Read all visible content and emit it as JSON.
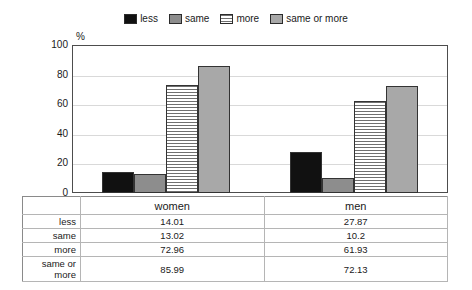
{
  "chart_data": {
    "type": "bar",
    "title": "",
    "xlabel": "",
    "ylabel": "%",
    "ylim": [
      0,
      100
    ],
    "yticks": [
      100,
      80,
      60,
      40,
      20,
      0
    ],
    "grid": true,
    "legend_position": "top-center",
    "categories": [
      "women",
      "men"
    ],
    "series": [
      {
        "name": "less",
        "values": [
          14.01,
          27.87
        ],
        "pattern": "solid-black",
        "color": "#111111"
      },
      {
        "name": "same",
        "values": [
          13.02,
          10.2
        ],
        "pattern": "solid-gray",
        "color": "#8d8d8d"
      },
      {
        "name": "more",
        "values": [
          72.96,
          61.93
        ],
        "pattern": "horizontal-lines",
        "color": "#ffffff"
      },
      {
        "name": "same or more",
        "values": [
          85.99,
          72.13
        ],
        "pattern": "solid-light-gray",
        "color": "#a8a8a8"
      }
    ]
  },
  "legend": {
    "items": [
      {
        "label": "less"
      },
      {
        "label": "same"
      },
      {
        "label": "more"
      },
      {
        "label": "same or more"
      }
    ]
  },
  "axis": {
    "unit_label": "%",
    "ticks": [
      "100",
      "80",
      "60",
      "40",
      "20",
      "0"
    ]
  },
  "categories": [
    {
      "label": "women"
    },
    {
      "label": "men"
    }
  ],
  "table": {
    "rows": [
      {
        "label": "less",
        "women": "14.01",
        "men": "27.87"
      },
      {
        "label": "same",
        "women": "13.02",
        "men": "10.2"
      },
      {
        "label": "more",
        "women": "72.96",
        "men": "61.93"
      },
      {
        "label": "same or more",
        "women": "85.99",
        "men": "72.13"
      }
    ]
  }
}
